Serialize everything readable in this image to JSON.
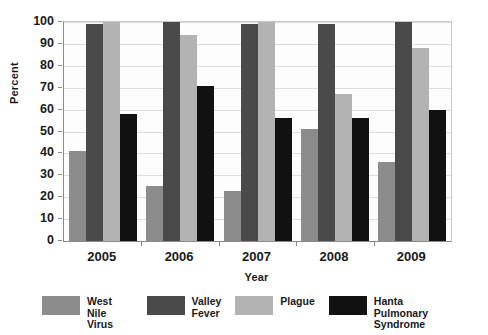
{
  "chart_data": {
    "type": "bar",
    "title": "",
    "subtitle": "",
    "xlabel": "Year",
    "ylabel": "Percent",
    "categories": [
      "2005",
      "2006",
      "2007",
      "2008",
      "2009"
    ],
    "ylim": [
      0,
      100
    ],
    "yticks": [
      0,
      10,
      20,
      30,
      40,
      50,
      60,
      70,
      80,
      90,
      100
    ],
    "grid": true,
    "legend_position": "bottom",
    "series": [
      {
        "name": "West Nile Virus",
        "legend_label": "West Nile\nVirus",
        "color": "#8c8c8c",
        "values": [
          41,
          25,
          23,
          51,
          36
        ]
      },
      {
        "name": "Valley Fever",
        "legend_label": "Valley\nFever",
        "color": "#4a4a4a",
        "values": [
          99,
          100,
          99,
          99,
          100
        ]
      },
      {
        "name": "Plague",
        "legend_label": "Plague",
        "color": "#b3b3b3",
        "values": [
          100,
          94,
          100,
          67,
          88
        ]
      },
      {
        "name": "Hanta Pulmonary Syndrome",
        "legend_label": "Hanta Pulmonary\nSyndrome",
        "color": "#111111",
        "values": [
          58,
          71,
          56,
          56,
          60
        ]
      }
    ]
  },
  "axes": {
    "y_label": "Percent",
    "x_label": "Year",
    "y_tick_labels": [
      "100",
      "90",
      "80",
      "70",
      "60",
      "50",
      "40",
      "30",
      "20",
      "10",
      "0"
    ],
    "x_tick_labels": [
      "2005",
      "2006",
      "2007",
      "2008",
      "2009"
    ]
  },
  "colors": {
    "west_nile": "#8c8c8c",
    "valley_fever": "#4a4a4a",
    "plague": "#b3b3b3",
    "hanta": "#111111",
    "gridline": "#dedede",
    "axis": "#8a8a8a",
    "background": "#ffffff"
  }
}
